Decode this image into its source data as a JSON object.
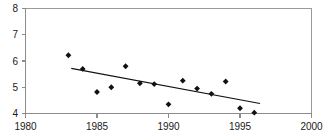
{
  "figure": {
    "clipped_title_fragment": "",
    "background_color": "#ffffff",
    "axis_color": "#8c8c8c",
    "marker_color": "#111111",
    "trend_color": "#111111"
  },
  "chart_data": {
    "type": "scatter",
    "title": "",
    "subtitle": "",
    "xlabel": "",
    "ylabel": "",
    "xlim": [
      1980,
      2000
    ],
    "ylim": [
      4,
      8
    ],
    "xticks": [
      1980,
      1985,
      1990,
      1995,
      2000
    ],
    "xtick_labels": [
      "1980",
      "1985",
      "1990",
      "1995",
      "2000"
    ],
    "yticks": [
      4,
      5,
      6,
      7,
      8
    ],
    "ytick_labels": [
      "4",
      "5",
      "6",
      "7",
      "8"
    ],
    "grid": false,
    "legend": null,
    "legend_position": "none",
    "x": [
      1983,
      1984,
      1985,
      1986,
      1987,
      1988,
      1989,
      1990,
      1991,
      1992,
      1993,
      1994,
      1995,
      1996
    ],
    "values": [
      6.22,
      5.7,
      4.82,
      5.0,
      5.8,
      5.15,
      5.12,
      4.35,
      5.25,
      4.95,
      4.75,
      5.22,
      4.2,
      4.03
    ],
    "series": [
      {
        "name": "observations",
        "marker": "diamond",
        "x": [
          1983,
          1984,
          1985,
          1986,
          1987,
          1988,
          1989,
          1990,
          1991,
          1992,
          1993,
          1994,
          1995,
          1996
        ],
        "values": [
          6.22,
          5.7,
          4.82,
          5.0,
          5.8,
          5.15,
          5.12,
          4.35,
          5.25,
          4.95,
          4.75,
          5.22,
          4.2,
          4.03
        ]
      }
    ],
    "trendline": {
      "type": "linear",
      "x_start": 1983.2,
      "y_start": 5.72,
      "x_end": 1996.4,
      "y_end": 4.38
    },
    "annotations": []
  }
}
